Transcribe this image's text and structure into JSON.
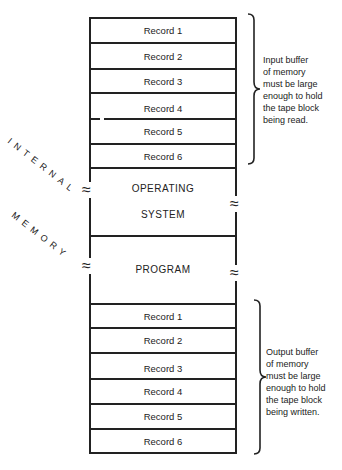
{
  "side_label": {
    "line1": "INTERNAL",
    "line2": "MEMORY"
  },
  "input_buffer": {
    "records": [
      "Record 1",
      "Record 2",
      "Record 3",
      "Record 4",
      "Record 5",
      "Record 6"
    ],
    "note": [
      "Input buffer",
      "of memory",
      "must be large",
      "enough to hold",
      "the tape block",
      "being read."
    ]
  },
  "operating_system": {
    "line1": "OPERATING",
    "line2": "SYSTEM"
  },
  "program": {
    "label": "PROGRAM"
  },
  "output_buffer": {
    "records": [
      "Record 1",
      "Record 2",
      "Record 3",
      "Record 4",
      "Record 5",
      "Record 6"
    ],
    "note": [
      "Output buffer",
      "of memory",
      "must be large",
      "enough to hold",
      "the tape block",
      "being written."
    ]
  },
  "break_symbol": "≈"
}
